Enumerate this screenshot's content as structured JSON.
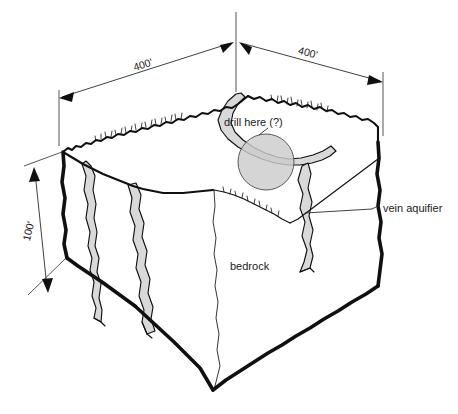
{
  "figure": {
    "type": "geologic-block-diagram",
    "background_color": "#ffffff",
    "ink_color": "#101010",
    "vein_fill_color": "#d9d9d9",
    "drill_circle_color": "#cccccc"
  },
  "dimensions": [
    {
      "id": "top-left-edge",
      "label": "400'",
      "value": 400,
      "unit": "feet",
      "orientation": "upper-left-oblique"
    },
    {
      "id": "top-right-edge",
      "label": "400'",
      "value": 400,
      "unit": "feet",
      "orientation": "upper-right-oblique"
    },
    {
      "id": "left-vertical-edge",
      "label": "100'",
      "value": 100,
      "unit": "feet",
      "orientation": "vertical-left"
    }
  ],
  "annotations": [
    {
      "id": "drill-here",
      "label": "drill here (?)",
      "kind": "leader-callout",
      "target": "drill-target-circle"
    },
    {
      "id": "vein-aquifier",
      "label": "vein aquifier",
      "kind": "leader-callout",
      "target": "vein-right-face"
    },
    {
      "id": "bedrock",
      "label": "bedrock",
      "kind": "interior-label",
      "target": "front-right-face"
    }
  ],
  "features": {
    "drill_target": {
      "name": "drill-target-circle",
      "shape": "circle",
      "shaded": true
    },
    "veins": [
      {
        "name": "vein-left-face"
      },
      {
        "name": "vein-front-left-face"
      },
      {
        "name": "vein-right-face"
      },
      {
        "name": "vein-top-surface"
      }
    ]
  }
}
